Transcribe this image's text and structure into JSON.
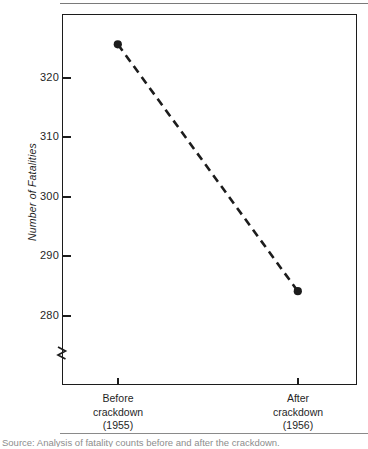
{
  "figure": {
    "kind": "line-chart-figure",
    "background_color": "#ffffff",
    "ink_color": "#1c1c1c",
    "source_caption": "Source: Analysis of fatality counts before and after the crackdown."
  },
  "chart_data": {
    "type": "line",
    "title": "",
    "subtitle": "",
    "xlabel": "",
    "ylabel": "Number of Fatalities",
    "categories": [
      "Before\ncrackdown\n(1955)",
      "After\ncrackdown\n(1956)"
    ],
    "category_lines": [
      [
        "Before",
        "crackdown",
        "(1955)"
      ],
      [
        "After",
        "crackdown",
        "(1956)"
      ]
    ],
    "x": [
      "Before crackdown (1955)",
      "After crackdown (1956)"
    ],
    "values": [
      325.5,
      284.0
    ],
    "series": [
      {
        "name": "Number of Fatalities",
        "values": [
          325.5,
          284.0
        ],
        "line_style": "dashed",
        "line_color": "#1c1c1c",
        "marker": "filled-circle",
        "marker_color": "#1c1c1c"
      }
    ],
    "ylim": [
      275.5,
      328.0
    ],
    "yticks": [
      280,
      290,
      300,
      310,
      320
    ],
    "ytick_labels": [
      "280",
      "290",
      "300",
      "310",
      "320"
    ],
    "y_axis_break": true,
    "y_axis_break_note": "zigzag break below 280",
    "grid": false,
    "legend": false,
    "legend_position": "none"
  },
  "axes": {
    "y_title": "Number of Fatalities",
    "y_ticks": [
      {
        "label": "320",
        "value": 320
      },
      {
        "label": "310",
        "value": 310
      },
      {
        "label": "300",
        "value": 300
      },
      {
        "label": "290",
        "value": 290
      },
      {
        "label": "280",
        "value": 280
      }
    ],
    "x_categories": [
      {
        "line1": "Before",
        "line2": "crackdown",
        "line3": "(1955)"
      },
      {
        "line1": "After",
        "line2": "crackdown",
        "line3": "(1956)"
      }
    ]
  }
}
